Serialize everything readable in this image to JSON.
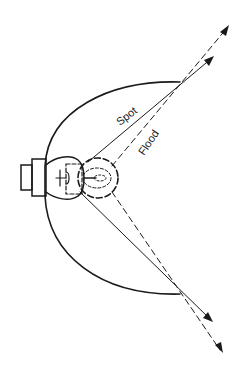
{
  "diagram": {
    "type": "headlamp reflector beam diagram",
    "labels": {
      "spot": "Spot",
      "flood": "Flood"
    },
    "elements": [
      {
        "name": "reflector",
        "shape": "semicircular arc"
      },
      {
        "name": "bulb",
        "shape": "bulb with base"
      },
      {
        "name": "spot-filament-focus",
        "shape": "dashed circle"
      },
      {
        "name": "spot-beam",
        "style": "solid lines with arrows"
      },
      {
        "name": "flood-beam",
        "style": "dashed lines with arrows"
      }
    ],
    "colors": {
      "ink": "#1a1a1a",
      "background": "#ffffff"
    }
  }
}
